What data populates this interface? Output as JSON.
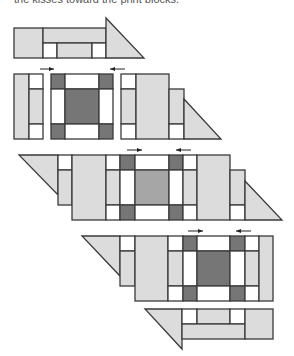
{
  "caption": "the kisses toward the print blocks.",
  "colors": {
    "light": "#dcdcdc",
    "dark": "#767676",
    "medium": "#a6a6a6",
    "white": "#ffffff",
    "stroke": "#3a3a3a"
  },
  "rows": [
    {
      "name": "row-1",
      "shapes": [
        {
          "t": "rect",
          "x": 14,
          "y": 28,
          "w": 29,
          "h": 30,
          "f": "light"
        },
        {
          "t": "rect",
          "x": 43,
          "y": 28,
          "w": 63,
          "h": 15,
          "f": "light"
        },
        {
          "t": "rect",
          "x": 43,
          "y": 43,
          "w": 14,
          "h": 15,
          "f": "white"
        },
        {
          "t": "rect",
          "x": 57,
          "y": 43,
          "w": 35,
          "h": 15,
          "f": "light"
        },
        {
          "t": "rect",
          "x": 92,
          "y": 43,
          "w": 14,
          "h": 15,
          "f": "white"
        },
        {
          "t": "poly",
          "p": "106,18 144,58 106,58",
          "f": "light"
        }
      ],
      "arrows": []
    },
    {
      "name": "row-2",
      "shapes": [
        {
          "t": "rect",
          "x": 14,
          "y": 74,
          "w": 15,
          "h": 65,
          "f": "light"
        },
        {
          "t": "rect",
          "x": 29,
          "y": 74,
          "w": 14,
          "h": 15,
          "f": "white"
        },
        {
          "t": "rect",
          "x": 29,
          "y": 89,
          "w": 14,
          "h": 35,
          "f": "light"
        },
        {
          "t": "rect",
          "x": 29,
          "y": 124,
          "w": 14,
          "h": 15,
          "f": "white"
        },
        {
          "t": "rect",
          "x": 51,
          "y": 74,
          "w": 14,
          "h": 15,
          "f": "dark"
        },
        {
          "t": "rect",
          "x": 65,
          "y": 74,
          "w": 34,
          "h": 15,
          "f": "white"
        },
        {
          "t": "rect",
          "x": 99,
          "y": 74,
          "w": 14,
          "h": 15,
          "f": "dark"
        },
        {
          "t": "rect",
          "x": 51,
          "y": 89,
          "w": 14,
          "h": 35,
          "f": "white"
        },
        {
          "t": "rect",
          "x": 65,
          "y": 89,
          "w": 34,
          "h": 35,
          "f": "dark"
        },
        {
          "t": "rect",
          "x": 99,
          "y": 89,
          "w": 14,
          "h": 35,
          "f": "white"
        },
        {
          "t": "rect",
          "x": 51,
          "y": 124,
          "w": 14,
          "h": 15,
          "f": "dark"
        },
        {
          "t": "rect",
          "x": 65,
          "y": 124,
          "w": 34,
          "h": 15,
          "f": "white"
        },
        {
          "t": "rect",
          "x": 99,
          "y": 124,
          "w": 14,
          "h": 15,
          "f": "dark"
        },
        {
          "t": "rect",
          "x": 121,
          "y": 74,
          "w": 15,
          "h": 15,
          "f": "white"
        },
        {
          "t": "rect",
          "x": 121,
          "y": 89,
          "w": 15,
          "h": 35,
          "f": "light"
        },
        {
          "t": "rect",
          "x": 121,
          "y": 124,
          "w": 15,
          "h": 15,
          "f": "white"
        },
        {
          "t": "rect",
          "x": 136,
          "y": 74,
          "w": 33,
          "h": 65,
          "f": "light"
        },
        {
          "t": "rect",
          "x": 169,
          "y": 89,
          "w": 15,
          "h": 35,
          "f": "light"
        },
        {
          "t": "rect",
          "x": 169,
          "y": 124,
          "w": 15,
          "h": 15,
          "f": "white"
        },
        {
          "t": "poly",
          "p": "184,99 221,139 184,139",
          "f": "light"
        }
      ],
      "arrows": [
        {
          "x1": 40,
          "x2": 54,
          "y": 69,
          "dir": "right"
        },
        {
          "x1": 110,
          "x2": 125,
          "y": 69,
          "dir": "left"
        }
      ]
    },
    {
      "name": "row-3",
      "shapes": [
        {
          "t": "poly",
          "p": "19,155 58,155 58,195",
          "f": "light"
        },
        {
          "t": "rect",
          "x": 58,
          "y": 155,
          "w": 14,
          "h": 15,
          "f": "white"
        },
        {
          "t": "rect",
          "x": 58,
          "y": 170,
          "w": 14,
          "h": 35,
          "f": "light"
        },
        {
          "t": "rect",
          "x": 72,
          "y": 155,
          "w": 34,
          "h": 65,
          "f": "light"
        },
        {
          "t": "rect",
          "x": 106,
          "y": 155,
          "w": 14,
          "h": 15,
          "f": "white"
        },
        {
          "t": "rect",
          "x": 106,
          "y": 170,
          "w": 14,
          "h": 35,
          "f": "light"
        },
        {
          "t": "rect",
          "x": 106,
          "y": 205,
          "w": 14,
          "h": 15,
          "f": "white"
        },
        {
          "t": "rect",
          "x": 120,
          "y": 155,
          "w": 15,
          "h": 15,
          "f": "dark"
        },
        {
          "t": "rect",
          "x": 135,
          "y": 155,
          "w": 34,
          "h": 15,
          "f": "white"
        },
        {
          "t": "rect",
          "x": 169,
          "y": 155,
          "w": 14,
          "h": 15,
          "f": "dark"
        },
        {
          "t": "rect",
          "x": 120,
          "y": 170,
          "w": 15,
          "h": 35,
          "f": "white"
        },
        {
          "t": "rect",
          "x": 135,
          "y": 170,
          "w": 34,
          "h": 35,
          "f": "medium"
        },
        {
          "t": "rect",
          "x": 169,
          "y": 170,
          "w": 14,
          "h": 35,
          "f": "white"
        },
        {
          "t": "rect",
          "x": 120,
          "y": 205,
          "w": 15,
          "h": 15,
          "f": "dark"
        },
        {
          "t": "rect",
          "x": 135,
          "y": 205,
          "w": 34,
          "h": 15,
          "f": "white"
        },
        {
          "t": "rect",
          "x": 169,
          "y": 205,
          "w": 14,
          "h": 15,
          "f": "dark"
        },
        {
          "t": "rect",
          "x": 183,
          "y": 155,
          "w": 14,
          "h": 15,
          "f": "white"
        },
        {
          "t": "rect",
          "x": 183,
          "y": 170,
          "w": 14,
          "h": 35,
          "f": "light"
        },
        {
          "t": "rect",
          "x": 183,
          "y": 205,
          "w": 14,
          "h": 15,
          "f": "white"
        },
        {
          "t": "rect",
          "x": 197,
          "y": 155,
          "w": 33,
          "h": 65,
          "f": "light"
        },
        {
          "t": "rect",
          "x": 230,
          "y": 170,
          "w": 15,
          "h": 35,
          "f": "light"
        },
        {
          "t": "rect",
          "x": 230,
          "y": 205,
          "w": 15,
          "h": 15,
          "f": "white"
        },
        {
          "t": "poly",
          "p": "245,181 282,220 245,220",
          "f": "light"
        }
      ],
      "arrows": [
        {
          "x1": 127,
          "x2": 142,
          "y": 150,
          "dir": "right"
        },
        {
          "x1": 176,
          "x2": 191,
          "y": 150,
          "dir": "left"
        }
      ]
    },
    {
      "name": "row-4",
      "shapes": [
        {
          "t": "poly",
          "p": "82,236 120,236 120,276",
          "f": "light"
        },
        {
          "t": "rect",
          "x": 120,
          "y": 236,
          "w": 15,
          "h": 15,
          "f": "white"
        },
        {
          "t": "rect",
          "x": 120,
          "y": 251,
          "w": 15,
          "h": 35,
          "f": "light"
        },
        {
          "t": "rect",
          "x": 135,
          "y": 236,
          "w": 33,
          "h": 65,
          "f": "light"
        },
        {
          "t": "rect",
          "x": 168,
          "y": 236,
          "w": 15,
          "h": 15,
          "f": "white"
        },
        {
          "t": "rect",
          "x": 168,
          "y": 251,
          "w": 15,
          "h": 35,
          "f": "light"
        },
        {
          "t": "rect",
          "x": 168,
          "y": 286,
          "w": 15,
          "h": 15,
          "f": "white"
        },
        {
          "t": "rect",
          "x": 183,
          "y": 236,
          "w": 14,
          "h": 15,
          "f": "dark"
        },
        {
          "t": "rect",
          "x": 197,
          "y": 236,
          "w": 33,
          "h": 15,
          "f": "white"
        },
        {
          "t": "rect",
          "x": 230,
          "y": 236,
          "w": 15,
          "h": 15,
          "f": "dark"
        },
        {
          "t": "rect",
          "x": 183,
          "y": 251,
          "w": 14,
          "h": 35,
          "f": "white"
        },
        {
          "t": "rect",
          "x": 197,
          "y": 251,
          "w": 33,
          "h": 35,
          "f": "dark"
        },
        {
          "t": "rect",
          "x": 230,
          "y": 251,
          "w": 15,
          "h": 35,
          "f": "white"
        },
        {
          "t": "rect",
          "x": 183,
          "y": 286,
          "w": 14,
          "h": 15,
          "f": "dark"
        },
        {
          "t": "rect",
          "x": 197,
          "y": 286,
          "w": 33,
          "h": 15,
          "f": "white"
        },
        {
          "t": "rect",
          "x": 230,
          "y": 286,
          "w": 15,
          "h": 15,
          "f": "dark"
        },
        {
          "t": "rect",
          "x": 245,
          "y": 236,
          "w": 14,
          "h": 15,
          "f": "white"
        },
        {
          "t": "rect",
          "x": 245,
          "y": 251,
          "w": 14,
          "h": 35,
          "f": "light"
        },
        {
          "t": "rect",
          "x": 245,
          "y": 286,
          "w": 14,
          "h": 15,
          "f": "white"
        },
        {
          "t": "rect",
          "x": 259,
          "y": 236,
          "w": 14,
          "h": 65,
          "f": "light"
        }
      ],
      "arrows": [
        {
          "x1": 188,
          "x2": 203,
          "y": 231,
          "dir": "right"
        },
        {
          "x1": 236,
          "x2": 251,
          "y": 231,
          "dir": "left"
        }
      ]
    },
    {
      "name": "row-5",
      "shapes": [
        {
          "t": "poly",
          "p": "145,309 182,309 182,349",
          "f": "light"
        },
        {
          "t": "rect",
          "x": 182,
          "y": 309,
          "w": 15,
          "h": 15,
          "f": "white"
        },
        {
          "t": "rect",
          "x": 197,
          "y": 309,
          "w": 33,
          "h": 15,
          "f": "light"
        },
        {
          "t": "rect",
          "x": 230,
          "y": 309,
          "w": 15,
          "h": 15,
          "f": "white"
        },
        {
          "t": "rect",
          "x": 182,
          "y": 324,
          "w": 63,
          "h": 15,
          "f": "light"
        },
        {
          "t": "rect",
          "x": 245,
          "y": 309,
          "w": 28,
          "h": 30,
          "f": "light"
        }
      ],
      "arrows": []
    }
  ]
}
